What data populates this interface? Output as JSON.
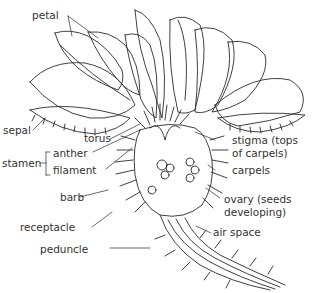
{
  "diagram": {
    "labels": {
      "petal": "petal",
      "sepal": "sepal",
      "torus": "torus",
      "stamen": "stamen",
      "anther": "anther",
      "filament": "filament",
      "barb": "barb",
      "receptacle": "receptacle",
      "peduncle": "peduncle",
      "stigma_line1": "stigma (tops",
      "stigma_line2": "of carpels)",
      "carpels": "carpels",
      "ovary_line1": "ovary (seeds",
      "ovary_line2": "developing)",
      "air_space": "air space"
    },
    "line_color": "#2a2a2a",
    "background": "#ffffff"
  }
}
